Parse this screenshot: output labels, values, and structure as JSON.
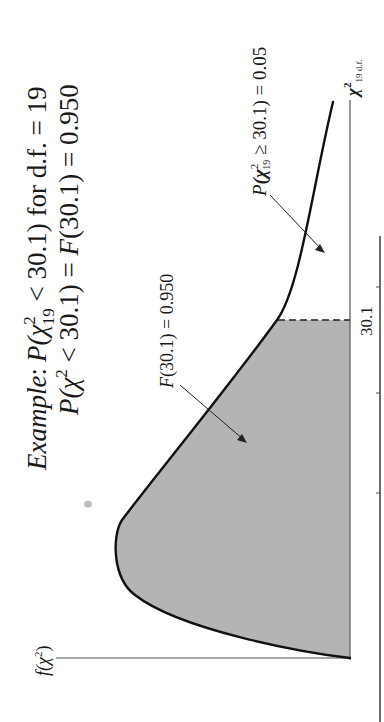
{
  "title": {
    "line1_prefix": "Example",
    "line1_colon": ":",
    "line1_p": "P",
    "line1_open": "(χ",
    "line1_sup": "2",
    "line1_sub": "19",
    "line1_rest": " < 30.1) for d.f. = 19",
    "line2_p": "P",
    "line2_open": "(χ",
    "line2_sup": "2",
    "line2_rest": " < 30.1) = ",
    "line2_f": "F",
    "line2_end": "(30.1) = 0.950"
  },
  "labels": {
    "y_axis_f": "f",
    "y_axis_rest": "(χ",
    "y_axis_sup": "2",
    "y_axis_close": ")",
    "shaded_f": "F",
    "shaded_rest": "(30.1) = 0.950",
    "tail_p": "P",
    "tail_open": "(χ",
    "tail_sup": "2",
    "tail_sub": "19",
    "tail_rest": " ≥ 30.1) = 0.05",
    "x_axis_chi": "χ",
    "x_axis_sup": "2",
    "x_axis_sub": "19 d.f.",
    "critical_value": "30.1"
  },
  "colors": {
    "shade": "#b4b4b4",
    "curve": "#111111",
    "axis": "#555555",
    "text": "#1a1a1a"
  },
  "diagram": {
    "distribution": "chi-square",
    "degrees_of_freedom": 19,
    "critical_value": 30.1,
    "area_left": 0.95,
    "area_right": 0.05,
    "orientation": "rotated 90° counter-clockwise"
  }
}
